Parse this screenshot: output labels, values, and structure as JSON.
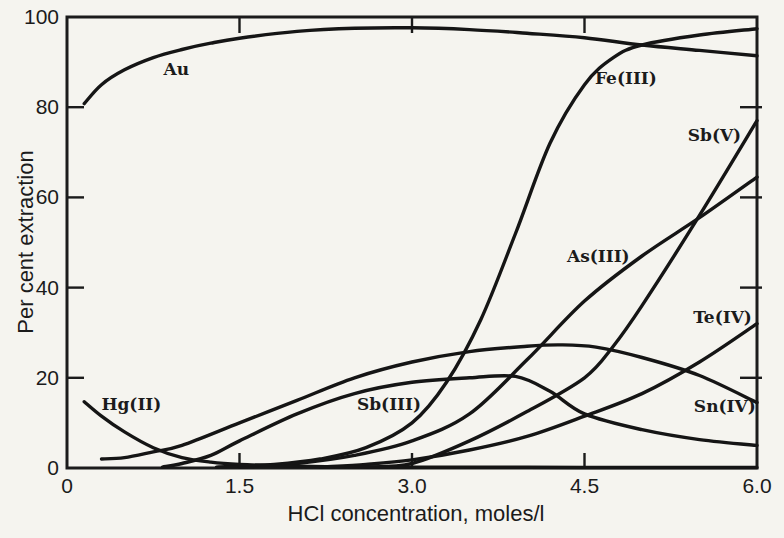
{
  "figure": {
    "background": "#f5f4ef",
    "ink": "#1b1b1b",
    "curve_color": "#151515"
  },
  "chart_data": {
    "type": "line",
    "title": "",
    "xlabel": "HCl concentration,  moles/l",
    "ylabel": "Per cent extraction",
    "xlim": [
      0,
      6
    ],
    "ylim": [
      0,
      100
    ],
    "grid": false,
    "legend": "inline curve labels",
    "frame": "full-box with inward ticks on all four sides",
    "x_tick_labels": [
      {
        "value": 0,
        "label": "0"
      },
      {
        "value": 1.5,
        "label": "1.5"
      },
      {
        "value": 3,
        "label": "3.0"
      },
      {
        "value": 4.5,
        "label": "4.5"
      },
      {
        "value": 6,
        "label": "6.0"
      }
    ],
    "x_inner_ticks": [
      1.5,
      3,
      4.5
    ],
    "y_tick_labels": [
      {
        "value": 0,
        "label": "0"
      },
      {
        "value": 20,
        "label": "20"
      },
      {
        "value": 40,
        "label": "40"
      },
      {
        "value": 60,
        "label": "60"
      },
      {
        "value": 80,
        "label": "80"
      },
      {
        "value": 100,
        "label": "100"
      }
    ],
    "y_inner_ticks": [
      20,
      40,
      60,
      80
    ],
    "series": [
      {
        "name": "Au",
        "label": {
          "text": "Au",
          "x": 0.95,
          "y": 88.4
        },
        "points": [
          [
            0.15,
            80.8
          ],
          [
            0.3,
            85
          ],
          [
            0.5,
            88.3
          ],
          [
            0.75,
            91
          ],
          [
            1,
            92.8
          ],
          [
            1.25,
            94.2
          ],
          [
            1.5,
            95.3
          ],
          [
            2,
            96.8
          ],
          [
            2.5,
            97.5
          ],
          [
            3,
            97.6
          ],
          [
            3.5,
            97.2
          ],
          [
            4,
            96.4
          ],
          [
            4.5,
            95.4
          ],
          [
            5,
            93.8
          ],
          [
            5.5,
            92.6
          ],
          [
            6,
            91.4
          ]
        ]
      },
      {
        "name": "Fe(III)",
        "label": {
          "text": "Fe(III)",
          "x": 4.86,
          "y": 86.5
        },
        "points": [
          [
            1.3,
            0.2
          ],
          [
            1.8,
            0.8
          ],
          [
            2.2,
            2
          ],
          [
            2.6,
            4.5
          ],
          [
            3,
            10
          ],
          [
            3.3,
            19
          ],
          [
            3.6,
            33
          ],
          [
            3.9,
            52
          ],
          [
            4.2,
            72
          ],
          [
            4.5,
            85
          ],
          [
            4.75,
            91
          ],
          [
            5,
            93.8
          ],
          [
            5.5,
            96
          ],
          [
            6,
            97.4
          ]
        ]
      },
      {
        "name": "Sb(V)",
        "label": {
          "text": "Sb(V)",
          "x": 5.63,
          "y": 73.8
        },
        "points": [
          [
            2.6,
            0.2
          ],
          [
            3,
            1
          ],
          [
            3.5,
            6
          ],
          [
            4,
            12.5
          ],
          [
            4.5,
            20
          ],
          [
            4.75,
            27
          ],
          [
            5,
            36
          ],
          [
            5.5,
            56
          ],
          [
            6,
            77
          ]
        ]
      },
      {
        "name": "As(III)",
        "label": {
          "text": "As(III)",
          "x": 4.62,
          "y": 47
        },
        "points": [
          [
            1.5,
            0.2
          ],
          [
            2,
            1
          ],
          [
            2.5,
            2.8
          ],
          [
            3,
            6
          ],
          [
            3.5,
            12
          ],
          [
            4,
            24
          ],
          [
            4.5,
            37
          ],
          [
            5,
            47
          ],
          [
            5.5,
            55.5
          ],
          [
            6,
            64.5
          ]
        ]
      },
      {
        "name": "Te(IV)",
        "label": {
          "text": "Te(IV)",
          "x": 5.7,
          "y": 33.4
        },
        "points": [
          [
            2.2,
            0.2
          ],
          [
            2.6,
            0.8
          ],
          [
            3,
            1.8
          ],
          [
            3.5,
            4
          ],
          [
            4,
            7
          ],
          [
            4.5,
            11.5
          ],
          [
            5,
            16.5
          ],
          [
            5.5,
            23.5
          ],
          [
            6,
            32
          ]
        ]
      },
      {
        "name": "Sn(IV)",
        "label": {
          "text": "Sn(IV)",
          "x": 5.72,
          "y": 13.8
        },
        "points": [
          [
            0.3,
            2
          ],
          [
            0.5,
            2.3
          ],
          [
            0.75,
            3.6
          ],
          [
            1,
            5
          ],
          [
            1.5,
            10
          ],
          [
            2,
            15
          ],
          [
            2.5,
            20
          ],
          [
            3,
            23.5
          ],
          [
            3.5,
            25.8
          ],
          [
            4,
            27
          ],
          [
            4.3,
            27.3
          ],
          [
            4.6,
            26.8
          ],
          [
            5,
            24.5
          ],
          [
            5.5,
            20.5
          ],
          [
            6,
            14.5
          ]
        ]
      },
      {
        "name": "Sb(III)",
        "label": {
          "text": "Sb(III)",
          "x": 2.8,
          "y": 14.3
        },
        "points": [
          [
            0.83,
            0.2
          ],
          [
            1,
            1
          ],
          [
            1.25,
            2.8
          ],
          [
            1.5,
            6
          ],
          [
            2,
            12
          ],
          [
            2.5,
            16.5
          ],
          [
            3,
            19
          ],
          [
            3.5,
            20
          ],
          [
            3.9,
            20.3
          ],
          [
            4.2,
            17
          ],
          [
            4.5,
            12
          ],
          [
            5,
            8.5
          ],
          [
            5.5,
            6.3
          ],
          [
            6,
            5
          ]
        ]
      },
      {
        "name": "Hg(II)",
        "label": {
          "text": "Hg(II)",
          "x": 0.56,
          "y": 14.2
        },
        "points": [
          [
            0.15,
            14.7
          ],
          [
            0.3,
            11.5
          ],
          [
            0.5,
            8
          ],
          [
            0.75,
            4.5
          ],
          [
            1,
            2.3
          ],
          [
            1.25,
            1.3
          ],
          [
            1.5,
            0.8
          ],
          [
            2,
            0.4
          ],
          [
            2.5,
            0.25
          ],
          [
            3,
            0.2
          ],
          [
            4,
            0.15
          ],
          [
            5,
            0.1
          ],
          [
            6,
            0.1
          ]
        ]
      }
    ]
  }
}
